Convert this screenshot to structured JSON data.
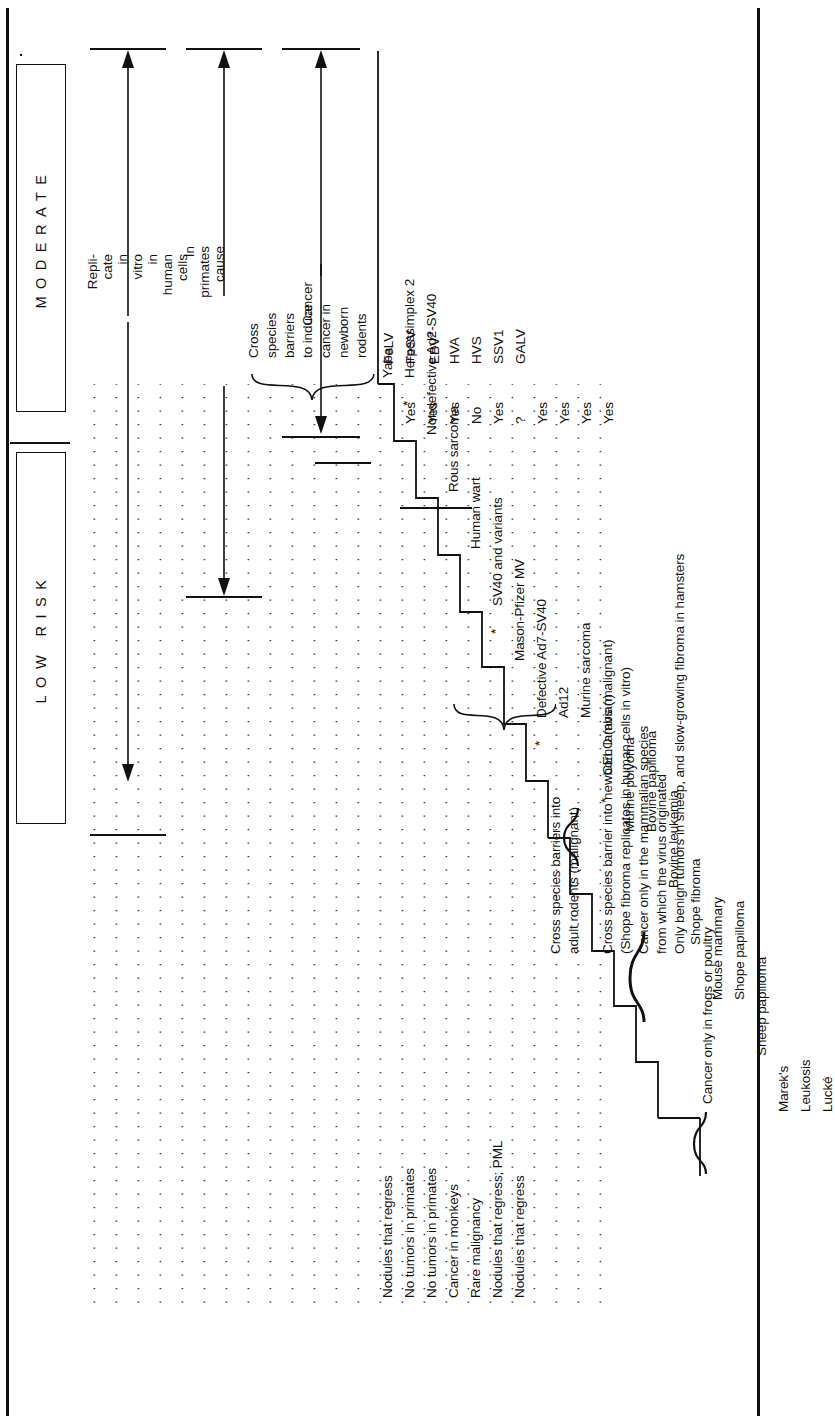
{
  "figure": {
    "orientation": "rotated-90-ccw",
    "ink_color": "#111111",
    "paper_color": "#ffffff"
  },
  "risk_headers": [
    {
      "id": "moderate",
      "label": "MODERATE"
    },
    {
      "id": "low-risk",
      "label": "LOW  RISK"
    }
  ],
  "scope_arrows": [
    {
      "id": "replicate",
      "lines": [
        "Repli-",
        "cate",
        "in",
        "vitro",
        "in",
        "human",
        "cells"
      ],
      "italic_lines": [
        2,
        3
      ]
    },
    {
      "id": "in-primates-cause",
      "lines": [
        "In",
        "primates",
        "cause"
      ],
      "italic_lines": []
    },
    {
      "id": "cancer",
      "lines": [
        "Cancer"
      ],
      "italic_lines": []
    }
  ],
  "rows": [
    {
      "effect": "Nodules that regress",
      "virus": "Yaba",
      "abbr": "",
      "abbr_sup": "",
      "cross": "",
      "star": false
    },
    {
      "effect": "No tumors in primates",
      "virus": "Herpessimplex 2",
      "abbr": "",
      "abbr_sup": "",
      "cross": "Yes",
      "star": true
    },
    {
      "effect": "No tumors in primates",
      "virus": "Nondefective Ad2-SV40",
      "abbr": "",
      "abbr_sup": "",
      "cross": "Yes",
      "star": false
    },
    {
      "effect": "Cancer in monkeys",
      "virus": "Rous sarcoma",
      "abbr": "",
      "abbr_sup": "",
      "cross": "Yes",
      "star": false
    },
    {
      "effect": "Rare malignancy",
      "virus": "Human wart",
      "abbr": "",
      "abbr_sup": "",
      "cross": "No",
      "star": false
    },
    {
      "effect": "Nodules that regress; PML",
      "virus": "SV40 and variants",
      "abbr": "",
      "abbr_sup": "",
      "cross": "Yes",
      "star": true
    },
    {
      "effect": "Nodules that regress",
      "virus": "Mason-Pfizer MV",
      "abbr": "",
      "abbr_sup": "",
      "cross": "?",
      "star": false
    },
    {
      "effect": "",
      "virus": "Defective Ad7-SV40",
      "abbr": "",
      "abbr_sup": "",
      "cross": "Yes",
      "star": true
    },
    {
      "effect": "",
      "virus": "Ad12",
      "abbr": "",
      "abbr_sup": "",
      "cross": "Yes",
      "star": false
    },
    {
      "effect": "",
      "virus": "Murine sarcoma",
      "abbr": "",
      "abbr_sup": "",
      "cross": "Yes",
      "star": false
    },
    {
      "effect": "",
      "virus": "CELO (avian)",
      "abbr": "",
      "abbr_sup": "",
      "cross": "Yes",
      "star": true
    },
    {
      "effect": "",
      "virus": "Murine polyoma",
      "abbr": "",
      "abbr_sup": "",
      "cross": "",
      "star": false
    },
    {
      "effect": "",
      "virus": "Bovine papilloma",
      "abbr": "",
      "abbr_sup": "",
      "cross": "",
      "star": false
    },
    {
      "effect": "",
      "virus": "Bovine leukemia",
      "abbr": "",
      "abbr_sup": "",
      "cross": "",
      "star": false
    },
    {
      "effect": "",
      "virus": "Shope fibroma",
      "abbr": "",
      "abbr_sup": "",
      "cross": "",
      "star": false
    },
    {
      "effect": "",
      "virus": "Mouse mammary",
      "abbr": "",
      "abbr_sup": "",
      "cross": "",
      "star": false
    },
    {
      "effect": "",
      "virus": "Shope papilloma",
      "abbr": "",
      "abbr_sup": "",
      "cross": "",
      "star": false
    },
    {
      "effect": "",
      "virus": "Sheep papilloma",
      "abbr": "",
      "abbr_sup": "",
      "cross": "",
      "star": false
    },
    {
      "effect": "",
      "virus": "Marek's",
      "abbr": "",
      "abbr_sup": "",
      "cross": "",
      "star": false
    },
    {
      "effect": "",
      "virus": "Leukosis",
      "abbr": "",
      "abbr_sup": "",
      "cross": "",
      "star": false
    },
    {
      "effect": "",
      "virus": "Lucké",
      "abbr": "",
      "abbr_sup": "",
      "cross": "",
      "star": false
    }
  ],
  "abbreviations": [
    {
      "text": "FeLV",
      "sup": ""
    },
    {
      "text": "FeSV",
      "sup": ""
    },
    {
      "text": "EBV",
      "sup": "a"
    },
    {
      "text": "HVA",
      "sup": ""
    },
    {
      "text": "HVS",
      "sup": ""
    },
    {
      "text": "SSV1",
      "sup": ""
    },
    {
      "text": "GALV",
      "sup": ""
    }
  ],
  "cross_species_caption": [
    "Cross",
    "species",
    "barriers",
    "to induce",
    "cancer in",
    "newborn",
    "rodents"
  ],
  "yes_no_column": [
    "Yes",
    "Yes",
    "Yes",
    "No",
    "Yes",
    "?",
    "Yes",
    "Yes",
    "Yes",
    "Yes"
  ],
  "annotations": [
    {
      "id": "cross-adult-rodents",
      "lines": [
        "Cross species barriers into",
        "adult rodents (malignant)"
      ]
    },
    {
      "id": "newborn-lambs",
      "lines": [
        "Cross species barrier into newborn lambs (malignant)",
        "(Shope fibroma replicates in human cells in vitro)"
      ],
      "italic_tail": "in vitro"
    },
    {
      "id": "mammalian-origin",
      "lines": [
        "Cancer only in the mammalian species",
        "from which the virus originated",
        "Only benign tumors in sheep, and slow-growing fibroma in hamsters"
      ]
    },
    {
      "id": "frogs-poultry",
      "lines": [
        "Cancer only in frogs or poultry"
      ]
    }
  ],
  "footnote_marker": "a",
  "star_marker": "*"
}
